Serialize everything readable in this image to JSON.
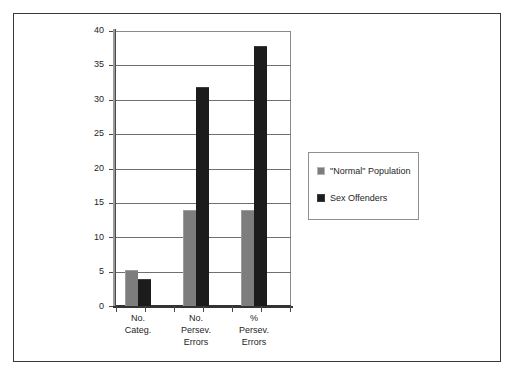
{
  "chart_data": {
    "type": "bar",
    "title": "",
    "subtitle": "",
    "xlabel": "",
    "ylabel": "",
    "ylim": [
      0,
      40
    ],
    "yticks": [
      0,
      5,
      10,
      15,
      20,
      25,
      30,
      35,
      40
    ],
    "ytick_labels": [
      "0",
      "5",
      "10",
      "15",
      "20",
      "25",
      "30",
      "35",
      "40"
    ],
    "grid": true,
    "legend_position": "right",
    "categories": [
      {
        "lines": [
          "No.",
          "Categ."
        ]
      },
      {
        "lines": [
          "No.",
          "Persev.",
          "Errors"
        ]
      },
      {
        "lines": [
          "%",
          "Persev.",
          "Errors"
        ]
      }
    ],
    "series": [
      {
        "name": "\"Normal\" Population",
        "color": "#7d7d7d",
        "values": [
          5.2,
          14.0,
          13.9
        ]
      },
      {
        "name": "Sex Offenders",
        "color": "#1c1c1c",
        "values": [
          4.0,
          31.8,
          37.8
        ]
      }
    ]
  },
  "legend": {
    "entries": [
      {
        "label": "\"Normal\" Population",
        "swatch": "gray-swatch"
      },
      {
        "label": "Sex Offenders",
        "swatch": "black-swatch"
      }
    ]
  }
}
